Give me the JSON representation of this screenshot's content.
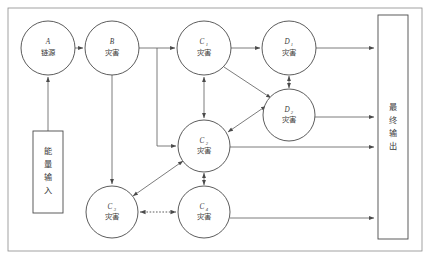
{
  "diagram": {
    "type": "flow-diagram",
    "frame_color": "#8a8a8a",
    "node_stroke_color": "#4a4a4a",
    "edge_color": "#5a5a5a",
    "background": "#ffffff",
    "nodes": [
      {
        "key": "A",
        "id_label": "A",
        "sub": "",
        "cn": "链源",
        "shape": "circle",
        "cx": 48,
        "cy": 48,
        "r": 27
      },
      {
        "key": "B",
        "id_label": "B",
        "sub": "",
        "cn": "灾害",
        "shape": "circle",
        "cx": 112,
        "cy": 48,
        "r": 27
      },
      {
        "key": "C1",
        "id_label": "C",
        "sub": "1",
        "cn": "灾害",
        "shape": "circle",
        "cx": 204,
        "cy": 48,
        "r": 27
      },
      {
        "key": "D1",
        "id_label": "D",
        "sub": "1",
        "cn": "灾害",
        "shape": "circle",
        "cx": 289,
        "cy": 48,
        "r": 27
      },
      {
        "key": "D2",
        "id_label": "D",
        "sub": "2",
        "cn": "灾害",
        "shape": "circle",
        "cx": 289,
        "cy": 115,
        "r": 26
      },
      {
        "key": "C2",
        "id_label": "C",
        "sub": "2",
        "cn": "灾害",
        "shape": "circle",
        "cx": 204,
        "cy": 146,
        "r": 26
      },
      {
        "key": "C3",
        "id_label": "C",
        "sub": "3",
        "cn": "灾害",
        "shape": "circle",
        "cx": 112,
        "cy": 212,
        "r": 26
      },
      {
        "key": "C4",
        "id_label": "C",
        "sub": "4",
        "cn": "灾害",
        "shape": "circle",
        "cx": 204,
        "cy": 212,
        "r": 26
      }
    ],
    "boxes": [
      {
        "key": "energy_input",
        "cn": "能量输入",
        "chars": [
          "能",
          "量",
          "输",
          "入"
        ],
        "x": 33,
        "y": 131,
        "w": 30,
        "h": 82
      },
      {
        "key": "final_output",
        "cn": "最终输出",
        "chars": [
          "最",
          "终",
          "输",
          "出"
        ],
        "x": 378,
        "y": 15,
        "w": 30,
        "h": 224
      }
    ],
    "edges": [
      {
        "from": "energy_input",
        "to": "A",
        "style": "solid",
        "arrow": "single"
      },
      {
        "from": "A",
        "to": "B",
        "style": "solid",
        "arrow": "single"
      },
      {
        "from": "B",
        "to": "C1",
        "style": "solid",
        "arrow": "single"
      },
      {
        "from": "B",
        "to": "C2",
        "style": "solid",
        "arrow": "single"
      },
      {
        "from": "B",
        "to": "C3",
        "style": "solid",
        "arrow": "single"
      },
      {
        "from": "C1",
        "to": "D1",
        "style": "solid",
        "arrow": "single"
      },
      {
        "from": "C1",
        "to": "D2",
        "style": "solid",
        "arrow": "single"
      },
      {
        "from": "C1",
        "to": "C2",
        "style": "solid",
        "arrow": "double"
      },
      {
        "from": "D1",
        "to": "D2",
        "style": "solid",
        "arrow": "double"
      },
      {
        "from": "C2",
        "to": "D2",
        "style": "solid",
        "arrow": "double"
      },
      {
        "from": "C2",
        "to": "C3",
        "style": "solid",
        "arrow": "double"
      },
      {
        "from": "C2",
        "to": "C4",
        "style": "solid",
        "arrow": "double"
      },
      {
        "from": "C3",
        "to": "C4",
        "style": "dashed",
        "arrow": "double"
      },
      {
        "from": "D1",
        "to": "final_output",
        "style": "solid",
        "arrow": "single"
      },
      {
        "from": "D2",
        "to": "final_output",
        "style": "solid",
        "arrow": "single"
      },
      {
        "from": "C2",
        "to": "final_output",
        "style": "solid",
        "arrow": "single"
      },
      {
        "from": "C4",
        "to": "final_output",
        "style": "solid",
        "arrow": "single"
      }
    ]
  }
}
